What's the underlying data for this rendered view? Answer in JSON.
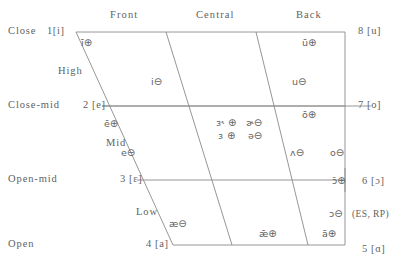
{
  "diagram": {
    "ink_color": "#5f5f5f",
    "column_headings": [
      {
        "id": "front",
        "label": "Front"
      },
      {
        "id": "central",
        "label": "Central"
      },
      {
        "id": "back",
        "label": "Back"
      }
    ],
    "left_height_labels": [
      {
        "id": "close",
        "label": "Close"
      },
      {
        "id": "close-mid",
        "label": "Close-mid"
      },
      {
        "id": "open-mid",
        "label": "Open-mid"
      },
      {
        "id": "open",
        "label": "Open"
      }
    ],
    "inner_band_labels": [
      {
        "id": "high",
        "label": "High"
      },
      {
        "id": "mid",
        "label": "Mid"
      },
      {
        "id": "low",
        "label": "Low"
      }
    ],
    "left_corner_numbers": [
      {
        "id": "c1",
        "label": "1[i]"
      },
      {
        "id": "c2",
        "label": "2 [e]"
      },
      {
        "id": "c3",
        "label": "3 [ɛ]"
      },
      {
        "id": "c4",
        "label": "4 [a]"
      }
    ],
    "right_corner_numbers": [
      {
        "id": "c8",
        "label": "8 [u]"
      },
      {
        "id": "c7",
        "label": "7 [o]"
      },
      {
        "id": "c6",
        "label": "6 [ɔ]"
      },
      {
        "id": "c5",
        "label": "5 [ɑ]"
      }
    ],
    "vowels": [
      {
        "id": "i-long",
        "symbol": "ī",
        "mark": "⊕"
      },
      {
        "id": "u-long",
        "symbol": "ū",
        "mark": "⊕"
      },
      {
        "id": "i-short",
        "symbol": "i",
        "mark": "⊖"
      },
      {
        "id": "u-short",
        "symbol": "u",
        "mark": "⊖"
      },
      {
        "id": "e-long",
        "symbol": "ē",
        "mark": "⊕"
      },
      {
        "id": "o-long",
        "symbol": "ō",
        "mark": "⊕"
      },
      {
        "id": "er-long",
        "symbol": "ɜ˞",
        "mark": "⊕"
      },
      {
        "id": "schwar",
        "symbol": "ɚ",
        "mark": "⊖"
      },
      {
        "id": "er-short",
        "symbol": "ɜ",
        "mark": "⊕"
      },
      {
        "id": "schwa",
        "symbol": "ə",
        "mark": "⊖"
      },
      {
        "id": "e-short",
        "symbol": "e",
        "mark": "⊖"
      },
      {
        "id": "wedge",
        "symbol": "ʌ",
        "mark": "⊖"
      },
      {
        "id": "o-short",
        "symbol": "o",
        "mark": "⊖"
      },
      {
        "id": "open-o-long",
        "symbol": "ɔ̄",
        "mark": "⊕"
      },
      {
        "id": "ash",
        "symbol": "æ",
        "mark": "⊖"
      },
      {
        "id": "ash-long",
        "symbol": "ǣ",
        "mark": "⊕"
      },
      {
        "id": "open-o",
        "symbol": "ɔ",
        "mark": "⊖"
      },
      {
        "id": "a-long",
        "symbol": "ā",
        "mark": "⊕"
      }
    ],
    "annotations": [
      {
        "id": "es-rp",
        "label": "(ES, RP)"
      }
    ]
  }
}
